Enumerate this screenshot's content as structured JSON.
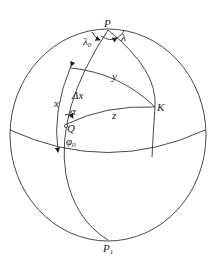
{
  "diagram": {
    "type": "spherical-geometry",
    "points": {
      "P": "P",
      "P1_base": "P",
      "P1_sub": "1",
      "K": "K",
      "Q": "Q"
    },
    "labels": {
      "lambda0_base": "λ",
      "lambda0_sub": "0",
      "lambda": "λ",
      "y": "y",
      "x": "x",
      "delta_x": "Δx",
      "alpha": "α",
      "z": "z",
      "phi0_base": "φ",
      "phi0_sub": "0"
    },
    "colors": {
      "stroke": "#333333",
      "background": "#ffffff"
    }
  }
}
